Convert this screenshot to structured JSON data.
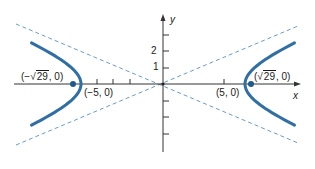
{
  "figure": {
    "equation_params": {
      "a": 5,
      "b": 2,
      "c_squared": 29
    },
    "axes": {
      "x_label": "x",
      "y_label": "y",
      "y_tick_labels": [
        "1",
        "2"
      ],
      "x_ticks_units": [
        -4,
        -3,
        -2,
        4
      ],
      "y_ticks_units": [
        -3,
        -2,
        -1,
        1,
        2,
        3
      ]
    },
    "labels": {
      "left_focus": {
        "prefix": "(−",
        "radicand": "29",
        "suffix": ", 0)"
      },
      "right_focus": {
        "prefix": "(",
        "radicand": "29",
        "suffix": ", 0)"
      },
      "left_vertex": "(−5, 0)",
      "right_vertex": "(5, 0)"
    },
    "colors": {
      "curve": "#2f6fa3",
      "asymptote": "#6a9cc9",
      "axis": "#333333",
      "point": "#1f5a8c"
    }
  }
}
